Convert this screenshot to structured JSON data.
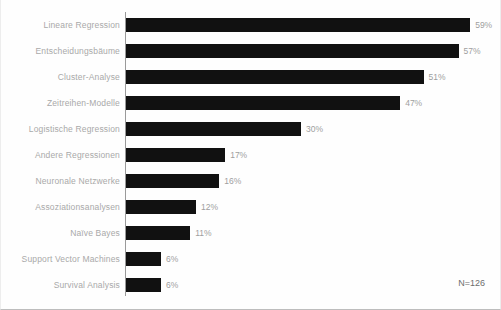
{
  "chart_data": {
    "type": "bar",
    "orientation": "horizontal",
    "title": "",
    "subtitle": "",
    "xlabel": "",
    "ylabel": "",
    "xlim": [
      0,
      60
    ],
    "grid": false,
    "legend": null,
    "value_suffix": "%",
    "categories": [
      "Lineare Regression",
      "Entscheidungsbäume",
      "Cluster-Analyse",
      "Zeitreihen-Modelle",
      "Logistische Regression",
      "Andere Regressionen",
      "Neuronale Netzwerke",
      "Assoziationsanalysen",
      "Naïve Bayes",
      "Support Vector Machines",
      "Survival Analysis"
    ],
    "values": [
      59,
      57,
      51,
      47,
      30,
      17,
      16,
      12,
      11,
      6,
      6
    ],
    "value_labels": [
      "59%",
      "57%",
      "51%",
      "47%",
      "30%",
      "17%",
      "16%",
      "12%",
      "11%",
      "6%",
      "6%"
    ],
    "annotation": "N=126",
    "bar_color": "#111111",
    "label_color": "#a9a9a9",
    "value_color": "#9e9e9e",
    "axis_color": "#9a9a9a",
    "background_color": "#fefefe"
  },
  "rows": [
    {
      "label": "Lineare Regression",
      "value": 59,
      "value_label": "59%"
    },
    {
      "label": "Entscheidungsbäume",
      "value": 57,
      "value_label": "57%"
    },
    {
      "label": "Cluster-Analyse",
      "value": 51,
      "value_label": "51%"
    },
    {
      "label": "Zeitreihen-Modelle",
      "value": 47,
      "value_label": "47%"
    },
    {
      "label": "Logistische Regression",
      "value": 30,
      "value_label": "30%"
    },
    {
      "label": "Andere Regressionen",
      "value": 17,
      "value_label": "17%"
    },
    {
      "label": "Neuronale Netzwerke",
      "value": 16,
      "value_label": "16%"
    },
    {
      "label": "Assoziationsanalysen",
      "value": 12,
      "value_label": "12%"
    },
    {
      "label": "Naïve Bayes",
      "value": 11,
      "value_label": "11%"
    },
    {
      "label": "Support Vector Machines",
      "value": 6,
      "value_label": "6%"
    },
    {
      "label": "Survival Analysis",
      "value": 6,
      "value_label": "6%"
    }
  ],
  "annotation": {
    "sample_size": "N=126"
  }
}
